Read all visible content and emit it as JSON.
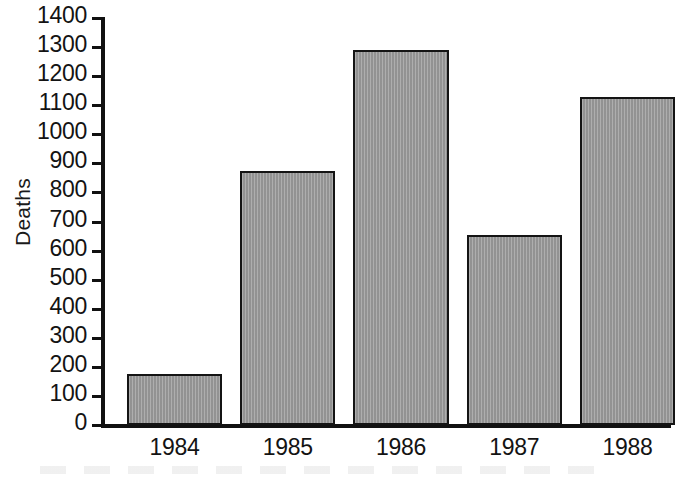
{
  "chart_data": {
    "type": "bar",
    "title": "",
    "xlabel": "",
    "ylabel": "Deaths",
    "categories": [
      "1984",
      "1985",
      "1986",
      "1987",
      "1988"
    ],
    "values": [
      175,
      875,
      1290,
      655,
      1130
    ],
    "ylim": [
      0,
      1400
    ],
    "ytick_step": 100,
    "yticks": [
      0,
      100,
      200,
      300,
      400,
      500,
      600,
      700,
      800,
      900,
      1000,
      1100,
      1200,
      1300,
      1400
    ],
    "ytick_labels": [
      "0",
      "100",
      "200",
      "300",
      "400",
      "500",
      "600",
      "700",
      "800",
      "900",
      "1000",
      "1100",
      "1200",
      "1300",
      "1400"
    ],
    "grid": false,
    "legend": null,
    "bar_color": "#9a9a9a",
    "bar_edge_color": "#141414",
    "axis_color": "#111111",
    "background_color": "#ffffff"
  },
  "axes": {
    "y_title": "Deaths"
  }
}
